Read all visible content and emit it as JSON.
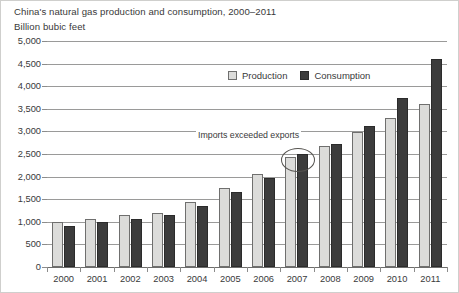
{
  "chart_data": {
    "type": "bar",
    "title": "China's natural gas production and consumption, 2000–2011",
    "subtitle": "Billion bubic feet",
    "xlabel": "",
    "ylabel": "Billion bubic feet",
    "ylim": [
      0,
      5000
    ],
    "ytick_labels": [
      "0",
      "500",
      "1,000",
      "1,500",
      "2,000",
      "2,500",
      "3,000",
      "3,500",
      "4,000",
      "4,500",
      "5,000"
    ],
    "ytick_values": [
      0,
      500,
      1000,
      1500,
      2000,
      2500,
      3000,
      3500,
      4000,
      4500,
      5000
    ],
    "grid": true,
    "legend_position": "top-center",
    "categories": [
      "2000",
      "2001",
      "2002",
      "2003",
      "2004",
      "2005",
      "2006",
      "2007",
      "2008",
      "2009",
      "2010",
      "2011"
    ],
    "series": [
      {
        "name": "Production",
        "color": "#dcdcda",
        "values": [
          1000,
          1070,
          1160,
          1200,
          1440,
          1740,
          2060,
          2430,
          2670,
          2990,
          3300,
          3600
        ]
      },
      {
        "name": "Consumption",
        "color": "#3c3c3c",
        "values": [
          910,
          990,
          1070,
          1160,
          1350,
          1660,
          1980,
          2490,
          2730,
          3110,
          3750,
          4600
        ]
      }
    ],
    "annotations": [
      {
        "text": "Imports exceeded exports",
        "target_category": "2007",
        "marker": "ellipse"
      }
    ]
  },
  "legend": {
    "items": [
      {
        "label": "Production"
      },
      {
        "label": "Consumption"
      }
    ]
  }
}
